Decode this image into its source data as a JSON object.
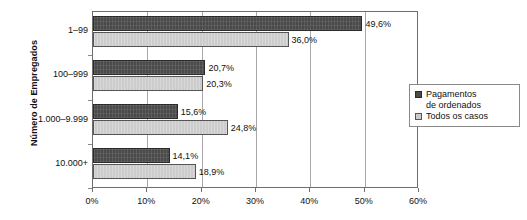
{
  "chart_data": {
    "type": "bar",
    "orientation": "horizontal",
    "title": "",
    "xlabel": "",
    "ylabel": "Número de Empregados",
    "categories": [
      "1–99",
      "100–999",
      "1.000–9.999",
      "10.000+"
    ],
    "series": [
      {
        "name": "Pagamentos de ordenados",
        "color": "#4a4a4a",
        "values": [
          49.6,
          20.7,
          15.6,
          14.1
        ],
        "value_labels": [
          "49,6%",
          "20,7%",
          "15,6%",
          "14,1%"
        ]
      },
      {
        "name": "Todos os casos",
        "color": "#cccccc",
        "values": [
          36.0,
          20.3,
          24.8,
          18.9
        ],
        "value_labels": [
          "36,0%",
          "20,3%",
          "24,8%",
          "18,9%"
        ]
      }
    ],
    "xlim": [
      0,
      60
    ],
    "xticks": [
      0,
      10,
      20,
      30,
      40,
      50,
      60
    ],
    "xtick_labels": [
      "0%",
      "10%",
      "20%",
      "30%",
      "40%",
      "50%",
      "60%"
    ],
    "grid": true,
    "grid_axis": "x",
    "legend_position": "right"
  },
  "legend": {
    "items": [
      {
        "label": "Pagamentos\nde ordenados",
        "swatch": "dark-square-icon"
      },
      {
        "label": "Todos os casos",
        "swatch": "light-square-icon"
      }
    ]
  }
}
